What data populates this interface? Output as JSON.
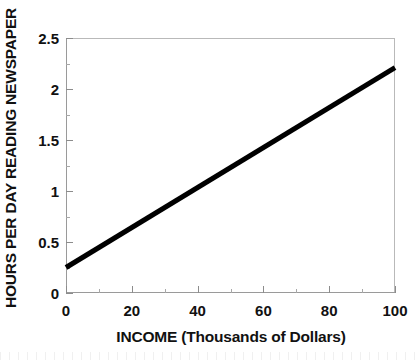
{
  "chart_data": {
    "type": "line",
    "title": "",
    "subtitle": "",
    "xlabel": "INCOME (Thousands of Dollars)",
    "ylabel": "HOURS PER DAY READING NEWSPAPER",
    "xlim": [
      0,
      100
    ],
    "ylim": [
      0,
      2.5
    ],
    "grid": false,
    "legend": null,
    "x_major_ticks": [
      0,
      20,
      40,
      60,
      80,
      100
    ],
    "x_major_tick_labels": [
      "0",
      "20",
      "40",
      "60",
      "80",
      "100"
    ],
    "x_minor_ticks": [
      10,
      30,
      50,
      70,
      90
    ],
    "y_major_ticks": [
      0,
      0.5,
      1,
      1.5,
      2,
      2.5
    ],
    "y_major_tick_labels": [
      "0",
      "0.5",
      "1",
      "1.5",
      "2",
      "2.5"
    ],
    "y_minor_ticks": [
      0.25,
      0.75,
      1.25,
      1.75,
      2.25
    ],
    "series": [
      {
        "name": "regression-line",
        "x": [
          0,
          100
        ],
        "values": [
          0.25,
          2.21
        ],
        "color": "#000000",
        "line_width": 5,
        "markers": false
      }
    ],
    "annotations": [],
    "colors": {
      "background": "#ffffff",
      "axis": "#9a9a9a",
      "frame": "#b9b9b9",
      "text": "#111111",
      "line": "#000000"
    }
  }
}
